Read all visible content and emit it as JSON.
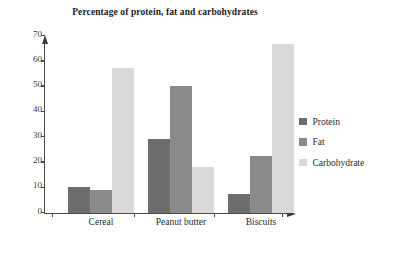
{
  "chart_data": {
    "type": "bar",
    "title": "Percentage of protein, fat and carbohydrates",
    "xlabel": "",
    "ylabel": "",
    "ylim": [
      0,
      70
    ],
    "yticks": [
      0,
      10,
      20,
      30,
      40,
      50,
      60,
      70
    ],
    "grid": false,
    "legend_position": "right",
    "categories": [
      "Cereal",
      "Peanut butter",
      "Biscuits"
    ],
    "series": [
      {
        "name": "Protein",
        "color": "#6d6d6d",
        "values": [
          10,
          29,
          7.5
        ]
      },
      {
        "name": "Fat",
        "color": "#8a8a8a",
        "values": [
          9,
          50,
          22.5
        ]
      },
      {
        "name": "Carbohydrate",
        "color": "#d9d9d9",
        "values": [
          57,
          18,
          66.5
        ]
      }
    ]
  }
}
